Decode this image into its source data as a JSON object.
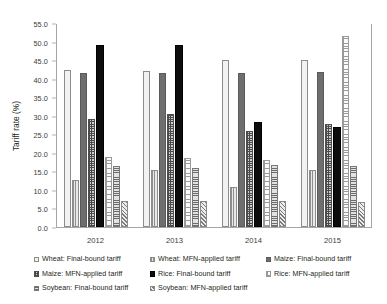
{
  "chart_data": {
    "type": "bar",
    "title": "",
    "xlabel": "",
    "ylabel": "Tariff rate (%)",
    "ylim": [
      0.0,
      55.0
    ],
    "ytick_step": 5.0,
    "grid": false,
    "legend_position": "bottom",
    "categories": [
      "2012",
      "2013",
      "2014",
      "2015"
    ],
    "ytick_labels": [
      "0.0",
      "5.0",
      "10.0",
      "15.0",
      "20.0",
      "25.0",
      "30.0",
      "35.0",
      "40.0",
      "45.0",
      "50.0",
      "55.0"
    ],
    "series": [
      {
        "name": "Wheat: Final-bound tariff",
        "swatch": "wheat-final-bound-swatch",
        "pattern": "f-wheat-fb",
        "values": [
          42.2,
          42.0,
          45.0,
          45.0
        ]
      },
      {
        "name": "Wheat: MFN-applied tariff",
        "swatch": "wheat-mfn-applied-swatch",
        "pattern": "f-wheat-mfn",
        "values": [
          12.8,
          15.5,
          10.7,
          15.3
        ]
      },
      {
        "name": "Maize: Final-bound tariff",
        "swatch": "maize-final-bound-swatch",
        "pattern": "f-maize-fb",
        "values": [
          41.6,
          41.5,
          41.5,
          41.8
        ]
      },
      {
        "name": "Maize: MFN-applied tariff",
        "swatch": "maize-mfn-applied-swatch",
        "pattern": "f-maize-mfn",
        "values": [
          29.0,
          30.5,
          25.8,
          27.7
        ]
      },
      {
        "name": "Rice: Final-bound tariff",
        "swatch": "rice-final-bound-swatch",
        "pattern": "f-rice-fb",
        "values": [
          49.0,
          49.0,
          28.3,
          26.9
        ]
      },
      {
        "name": "Rice: MFN-applied tariff",
        "swatch": "rice-mfn-applied-swatch",
        "pattern": "f-rice-mfn",
        "values": [
          18.8,
          18.7,
          18.0,
          51.5
        ]
      },
      {
        "name": "Soybean: Final-bound tariff",
        "swatch": "soybean-final-bound-swatch",
        "pattern": "f-soy-fb",
        "values": [
          16.5,
          16.0,
          16.8,
          16.5
        ]
      },
      {
        "name": "Soybean: MFN-applied tariff",
        "swatch": "soybean-mfn-applied-swatch",
        "pattern": "f-soy-mfn",
        "values": [
          6.9,
          6.9,
          6.9,
          6.8
        ]
      }
    ]
  }
}
